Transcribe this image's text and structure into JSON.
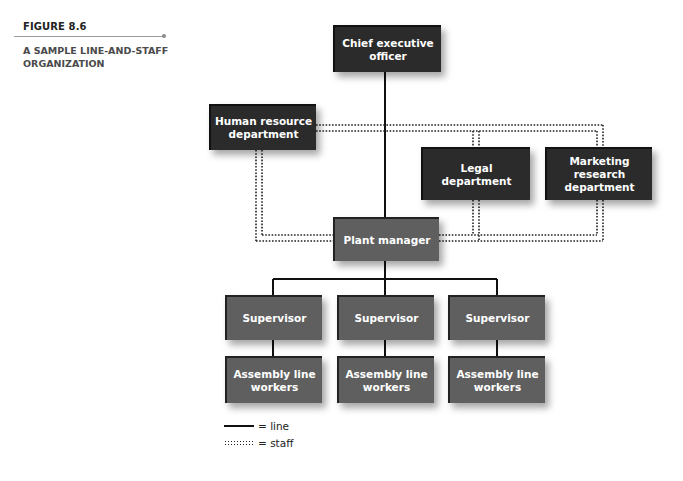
{
  "figure": {
    "label": "FIGURE 8.6",
    "title": "A SAMPLE LINE-AND-STAFF ORGANIZATION"
  },
  "boxes": {
    "ceo": "Chief executive\nofficer",
    "hr": "Human resource\ndepartment",
    "legal": "Legal\ndepartment",
    "marketing": "Marketing\nresearch\ndepartment",
    "plant_manager": "Plant manager",
    "supervisors": [
      "Supervisor",
      "Supervisor",
      "Supervisor"
    ],
    "workers": [
      "Assembly line\nworkers",
      "Assembly line\nworkers",
      "Assembly line\nworkers"
    ]
  },
  "legend": {
    "line_label": "= line",
    "staff_label": "= staff"
  },
  "colors": {
    "dark_box": "#2b2b2b",
    "mid_box": "#5f5f5f",
    "line": "#111111"
  }
}
